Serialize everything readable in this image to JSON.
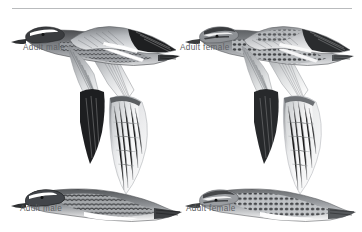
{
  "plate": {
    "kind": "field-guide-illustration-plate",
    "subject": "Garganey ducks in flight",
    "background_color": "#ffffff",
    "rule_color": "#b9bbbd",
    "caption_color": "#5d6064"
  },
  "captions": {
    "top_left": "Adult male",
    "top_right": "Adult female",
    "bottom_left": "Adult male",
    "bottom_right": "Adult female"
  },
  "figures": [
    {
      "id": "bird-top-left",
      "label": "Adult male",
      "view": "upperwing",
      "position": "top-left",
      "plumage_notes": "dark head with bold white supercilium, dark scapulars, pale blue-grey forewing, dark flight feathers, white greater-covert bar"
    },
    {
      "id": "bird-top-right",
      "label": "Adult female",
      "view": "upperwing",
      "position": "top-right",
      "plumage_notes": "brown head with pale supercilium and dark eyestripe, mottled brown body, grey-brown forewing, narrow white wingbar"
    },
    {
      "id": "bird-bottom-left",
      "label": "Adult male",
      "view": "underwing",
      "position": "bottom-left",
      "plumage_notes": "white underwing with dark leading edge, barred breast, white belly, dark-speckled flanks, white head stripe"
    },
    {
      "id": "bird-bottom-right",
      "label": "Adult female",
      "view": "underwing",
      "position": "bottom-right",
      "plumage_notes": "whitish underwing, heavily spotted brown breast and flanks, pale belly, striped face pattern"
    }
  ],
  "palette": {
    "ink_dark": "#2b2b2d",
    "ink_black": "#171718",
    "ink_mid": "#6e7175",
    "ink_light": "#b4b7bb",
    "ink_pale": "#dcdee0",
    "white": "#ffffff"
  }
}
